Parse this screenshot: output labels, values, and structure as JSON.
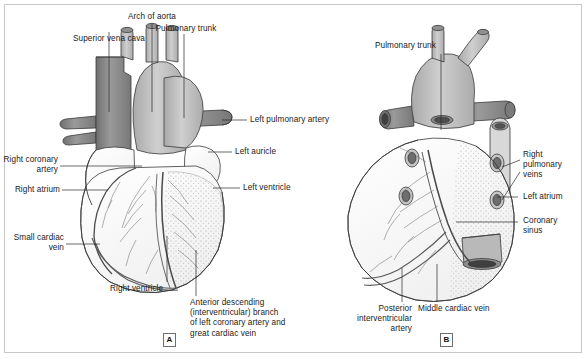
{
  "figure": {
    "background": "#ffffff",
    "border_color": "#c9c9c9",
    "width": 588,
    "height": 359
  },
  "palette": {
    "vein_dark": "#8c8c8c",
    "artery_mid": "#bdbdbd",
    "muscle_light": "#fbfbfb",
    "outline": "#3a3a3a",
    "stipple": "#9a9a9a",
    "text": "#1a1a1a"
  },
  "panels": [
    {
      "tag": "A",
      "name": "anterior-view",
      "description": "Anterior (sternocostal) surface of the heart"
    },
    {
      "tag": "B",
      "name": "posterior-view",
      "description": "Posterior (diaphragmatic) surface of the heart"
    }
  ],
  "panel_a": {
    "tag": "A",
    "labels": [
      {
        "id": "superior-vena-cava",
        "text": "Superior vena cava"
      },
      {
        "id": "arch-of-aorta",
        "text": "Arch of aorta"
      },
      {
        "id": "pulmonary-trunk",
        "text": "Pulmonary trunk"
      },
      {
        "id": "left-pulmonary-artery",
        "text": "Left pulmonary artery"
      },
      {
        "id": "left-auricle",
        "text": "Left auricle"
      },
      {
        "id": "left-ventricle",
        "text": "Left ventricle"
      },
      {
        "id": "right-coronary-artery",
        "text": "Right coronary\nartery"
      },
      {
        "id": "right-atrium",
        "text": "Right atrium"
      },
      {
        "id": "small-cardiac-vein",
        "text": "Small cardiac\nvein"
      },
      {
        "id": "right-ventricle",
        "text": "Right ventricle"
      },
      {
        "id": "anterior-descending-branch",
        "text": "Anterior descending\n(interventricular) branch\nof left coronary artery and\ngreat cardiac vein"
      }
    ]
  },
  "panel_b": {
    "tag": "B",
    "labels": [
      {
        "id": "pulmonary-trunk",
        "text": "Pulmonary trunk"
      },
      {
        "id": "right-pulmonary-veins",
        "text": "Right\npulmonary\nveins"
      },
      {
        "id": "left-atrium",
        "text": "Left atrium"
      },
      {
        "id": "coronary-sinus",
        "text": "Coronary\nsinus"
      },
      {
        "id": "posterior-interventricular-artery",
        "text": "Posterior\ninterventricular\nartery"
      },
      {
        "id": "middle-cardiac-vein",
        "text": "Middle cardiac vein"
      }
    ]
  }
}
